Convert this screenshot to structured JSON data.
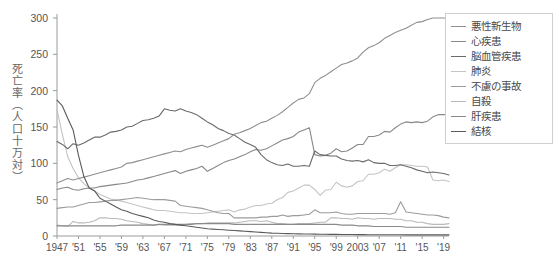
{
  "chart_data": {
    "type": "line",
    "title": "",
    "xlabel": "",
    "ylabel": "死亡率（人口十万対）",
    "ylim": [
      0,
      300
    ],
    "yticks": [
      0,
      50,
      100,
      150,
      200,
      250,
      300
    ],
    "xlim": [
      1947,
      2020
    ],
    "xtick_labels": [
      "1947",
      "'51",
      "'55",
      "'59",
      "'63",
      "'67",
      "'71",
      "'75",
      "'79",
      "'83",
      "'87",
      "'91",
      "'95",
      "'99",
      "2003",
      "'07",
      "'11",
      "'15",
      "'19"
    ],
    "xtick_values": [
      1947,
      1951,
      1955,
      1959,
      1963,
      1967,
      1971,
      1975,
      1979,
      1983,
      1987,
      1991,
      1995,
      1999,
      2003,
      2007,
      2011,
      2015,
      2019
    ],
    "grid": false,
    "legend_position": "right",
    "x": [
      1947,
      1948,
      1949,
      1950,
      1951,
      1952,
      1953,
      1954,
      1955,
      1956,
      1957,
      1958,
      1959,
      1960,
      1961,
      1962,
      1963,
      1964,
      1965,
      1966,
      1967,
      1968,
      1969,
      1970,
      1971,
      1972,
      1973,
      1974,
      1975,
      1976,
      1977,
      1978,
      1979,
      1980,
      1981,
      1982,
      1983,
      1984,
      1985,
      1986,
      1987,
      1988,
      1989,
      1990,
      1991,
      1992,
      1993,
      1994,
      1995,
      1996,
      1997,
      1998,
      1999,
      2000,
      2001,
      2002,
      2003,
      2004,
      2005,
      2006,
      2007,
      2008,
      2009,
      2010,
      2011,
      2012,
      2013,
      2014,
      2015,
      2016,
      2017,
      2018,
      2019,
      2020
    ],
    "series": [
      {
        "name": "悪性新生物",
        "color": "#8f8f8f",
        "values": [
          73,
          76,
          79,
          77,
          79,
          81,
          83,
          85,
          87,
          89,
          91,
          93,
          95,
          100,
          101,
          103,
          105,
          107,
          109,
          111,
          113,
          115,
          117,
          116,
          119,
          121,
          123,
          125,
          122,
          125,
          128,
          131,
          134,
          140,
          142,
          145,
          148,
          152,
          156,
          158,
          162,
          166,
          171,
          177,
          183,
          188,
          190,
          196,
          211,
          217,
          221,
          226,
          231,
          236,
          238,
          241,
          245,
          253,
          259,
          262,
          266,
          272,
          276,
          280,
          283,
          286,
          290,
          294,
          295,
          298,
          300,
          300,
          300,
          300
        ]
      },
      {
        "name": "心疾患",
        "color": "#888888",
        "values": [
          64,
          66,
          67,
          64,
          63,
          65,
          66,
          66,
          68,
          69,
          70,
          71,
          72,
          73,
          75,
          77,
          78,
          80,
          82,
          84,
          86,
          88,
          90,
          86,
          89,
          91,
          93,
          96,
          89,
          93,
          97,
          101,
          104,
          106,
          109,
          112,
          116,
          119,
          118,
          120,
          124,
          128,
          132,
          134,
          137,
          143,
          146,
          149,
          112,
          110,
          111,
          114,
          120,
          116,
          117,
          121,
          126,
          126,
          137,
          137,
          139,
          144,
          143,
          149,
          154,
          157,
          156,
          157,
          156,
          158,
          164,
          167,
          167,
          167
        ]
      },
      {
        "name": "脳血管疾患",
        "color": "#6a6a6a",
        "values": [
          130,
          126,
          120,
          127,
          125,
          128,
          132,
          136,
          136,
          139,
          143,
          144,
          146,
          150,
          151,
          155,
          159,
          160,
          162,
          165,
          175,
          173,
          172,
          175,
          172,
          170,
          167,
          162,
          157,
          153,
          148,
          145,
          141,
          139,
          134,
          129,
          126,
          122,
          112,
          105,
          101,
          98,
          97,
          99,
          96,
          96,
          97,
          96,
          117,
          112,
          111,
          110,
          110,
          106,
          104,
          103,
          104,
          102,
          105,
          101,
          100,
          100,
          97,
          97,
          98,
          96,
          94,
          91,
          89,
          87,
          88,
          87,
          86,
          84
        ]
      },
      {
        "name": "肺炎",
        "color": "#c4c4c4",
        "values": [
          174,
          140,
          109,
          93,
          80,
          72,
          66,
          62,
          57,
          54,
          51,
          50,
          48,
          46,
          44,
          42,
          40,
          38,
          36,
          35,
          35,
          34,
          33,
          32,
          32,
          31,
          31,
          31,
          32,
          33,
          34,
          35,
          36,
          33,
          36,
          37,
          40,
          42,
          42,
          44,
          45,
          50,
          53,
          60,
          62,
          66,
          70,
          70,
          64,
          56,
          63,
          64,
          74,
          69,
          67,
          69,
          75,
          76,
          85,
          85,
          87,
          92,
          89,
          94,
          98,
          98,
          97,
          96,
          96,
          95,
          77,
          76,
          77,
          75
        ]
      },
      {
        "name": "不慮の事故",
        "color": "#9c9c9c",
        "values": [
          38,
          39,
          40,
          40,
          42,
          44,
          46,
          46,
          47,
          48,
          49,
          49,
          50,
          51,
          52,
          53,
          52,
          51,
          50,
          50,
          50,
          49,
          48,
          42,
          41,
          40,
          39,
          38,
          36,
          34,
          32,
          31,
          31,
          25,
          25,
          25,
          25,
          25,
          26,
          26,
          27,
          27,
          29,
          27,
          28,
          28,
          29,
          30,
          36,
          32,
          32,
          32,
          33,
          31,
          30,
          30,
          31,
          31,
          31,
          31,
          31,
          31,
          30,
          32,
          47,
          33,
          32,
          31,
          30,
          29,
          29,
          28,
          26,
          25
        ]
      },
      {
        "name": "自殺",
        "color": "#b9b9b9",
        "values": [
          15,
          14,
          13,
          20,
          18,
          18,
          19,
          21,
          25,
          25,
          24,
          24,
          23,
          21,
          20,
          19,
          17,
          16,
          15,
          16,
          15,
          15,
          15,
          15,
          16,
          17,
          17,
          17,
          18,
          18,
          18,
          18,
          18,
          18,
          19,
          20,
          21,
          21,
          20,
          21,
          19,
          17,
          17,
          16,
          16,
          17,
          17,
          17,
          18,
          19,
          19,
          25,
          25,
          24,
          24,
          23,
          25,
          24,
          24,
          23,
          24,
          24,
          24,
          23,
          23,
          21,
          21,
          19,
          19,
          17,
          16,
          16,
          16,
          17
        ]
      },
      {
        "name": "肝疾患",
        "color": "#8a8a8a",
        "values": [
          14,
          14,
          14,
          14,
          14,
          14,
          14,
          14,
          14,
          14,
          14,
          14,
          15,
          15,
          15,
          15,
          15,
          15,
          15,
          16,
          16,
          16,
          16,
          16,
          16,
          16,
          17,
          17,
          17,
          17,
          17,
          17,
          17,
          16,
          16,
          16,
          16,
          16,
          16,
          16,
          16,
          16,
          16,
          16,
          16,
          16,
          16,
          16,
          16,
          16,
          16,
          16,
          16,
          15,
          15,
          15,
          14,
          14,
          14,
          13,
          13,
          13,
          13,
          13,
          13,
          12,
          12,
          12,
          12,
          12,
          12,
          12,
          12,
          12
        ]
      },
      {
        "name": "結核",
        "color": "#5a5a5a",
        "values": [
          187,
          179,
          162,
          146,
          111,
          82,
          66,
          62,
          52,
          48,
          44,
          40,
          36,
          34,
          31,
          29,
          27,
          25,
          22,
          20,
          19,
          17,
          16,
          15,
          14,
          13,
          12,
          11,
          10,
          9.5,
          9,
          8.5,
          8,
          7.5,
          7,
          6.5,
          6,
          5.5,
          5,
          4.5,
          4,
          3.8,
          3.5,
          3.3,
          3,
          2.9,
          2.8,
          2.7,
          2.6,
          2.5,
          2.4,
          2.3,
          2.2,
          2.1,
          2,
          2,
          1.9,
          1.9,
          1.8,
          1.8,
          1.8,
          1.7,
          1.7,
          1.7,
          1.7,
          1.6,
          1.6,
          1.6,
          1.6,
          1.5,
          1.5,
          1.5,
          1.5,
          1.5
        ]
      }
    ]
  },
  "legend": {
    "items": [
      {
        "label": "悪性新生物"
      },
      {
        "label": "心疾患"
      },
      {
        "label": "脳血管疾患"
      },
      {
        "label": "肺炎"
      },
      {
        "label": "不慮の事故"
      },
      {
        "label": "自殺"
      },
      {
        "label": "肝疾患"
      },
      {
        "label": "結核"
      }
    ]
  },
  "axis": {
    "y_title": "死亡率（人口十万対）"
  }
}
